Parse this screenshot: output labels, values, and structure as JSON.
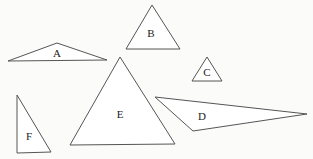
{
  "diagram": {
    "shapes": [
      {
        "label": "A",
        "points": "8,61 57,43 107,60",
        "lx": 57,
        "ly": 54
      },
      {
        "label": "B",
        "points": "126,49 152,5 180,49",
        "lx": 151,
        "ly": 34
      },
      {
        "label": "C",
        "points": "192,81 207,57 222,81",
        "lx": 207,
        "ly": 73
      },
      {
        "label": "D",
        "points": "155,97 307,114 193,131",
        "lx": 202,
        "ly": 117
      },
      {
        "label": "E",
        "points": "70,145 120,57 175,144",
        "lx": 120,
        "ly": 115
      },
      {
        "label": "F",
        "points": "17,95 17,153 51,152",
        "lx": 29,
        "ly": 137
      }
    ]
  }
}
